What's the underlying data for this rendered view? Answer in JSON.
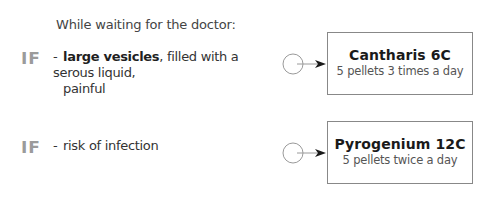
{
  "intro": "While waiting for the doctor:",
  "rows": [
    {
      "badge": "IF",
      "dash": "-",
      "condition_bold": "large vesicles",
      "condition_rest": ", filled with a serous liquid,",
      "condition_cont": "painful",
      "connector_icon": "circle-arrow-icon",
      "remedy": {
        "name": "Cantharis 6C",
        "dose": "5 pellets 3 times a day"
      }
    },
    {
      "badge": "IF",
      "dash": "-",
      "condition_bold": "",
      "condition_rest": "risk of infection",
      "condition_cont": "",
      "connector_icon": "circle-arrow-icon",
      "remedy": {
        "name": "Pyrogenium 12C",
        "dose": "5 pellets twice a day"
      }
    }
  ],
  "colors": {
    "badge": "#9b9b9b",
    "box_border": "#888888",
    "text": "#333333",
    "connector": "#999999",
    "arrowhead": "#1a1a1a"
  }
}
